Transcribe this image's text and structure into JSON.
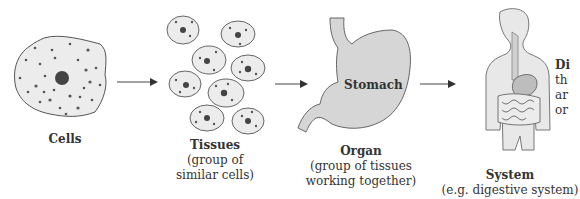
{
  "stages": [
    {
      "title": "Cells",
      "subtitle": []
    },
    {
      "title": "Tissues",
      "subtitle": [
        "(group of",
        "similar cells)"
      ]
    },
    {
      "title": "Organ",
      "subtitle": [
        "(group of tissues",
        "working together)"
      ]
    },
    {
      "title": "System",
      "subtitle": [
        "(e.g. digestive system)"
      ]
    }
  ],
  "organ_inner_label": "Stomach",
  "side_text": [
    "Di",
    "th",
    "ar",
    "or"
  ],
  "colors": {
    "fill": "#e6e6e6",
    "stroke": "#555555",
    "dark": "#444444",
    "organ_fill": "#d0d0d0"
  }
}
